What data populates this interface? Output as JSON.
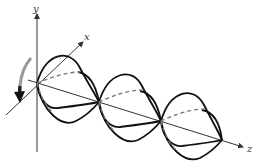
{
  "diagram": {
    "title": "",
    "axes": {
      "x_label": "x",
      "y_label": "y",
      "z_label": "z"
    },
    "rotation_arrow": "counter-clockwise curved arrow",
    "nodes": 4,
    "colors": {
      "wave": "#111111",
      "dashed": "#777777",
      "axis": "#333333"
    }
  }
}
